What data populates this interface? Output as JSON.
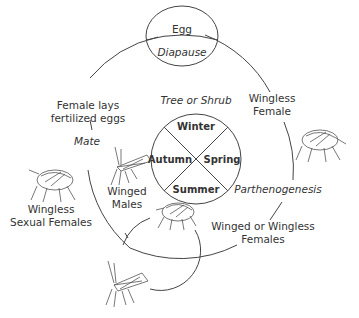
{
  "diagram": {
    "type": "life-cycle",
    "egg": {
      "title": "Egg",
      "subtitle": "Diapause"
    },
    "host": {
      "label": "Tree or Shrub",
      "seasons": [
        "Winter",
        "Spring",
        "Summer",
        "Autumn"
      ]
    },
    "stages": {
      "wingless_female": [
        "Wingless",
        "Female"
      ],
      "parthenogenesis": "Parthenogenesis",
      "winged_or_wingless_females": [
        "Winged or Wingless",
        "Females"
      ],
      "winged_males": [
        "Winged",
        "Males"
      ],
      "wingless_sexual_females": [
        "Wingless",
        "Sexual Females"
      ],
      "mate": "Mate",
      "female_lays_eggs": [
        "Female lays",
        "fertilized eggs"
      ]
    },
    "colors": {
      "line": "#444444",
      "text": "#333333",
      "background": "#ffffff"
    }
  }
}
